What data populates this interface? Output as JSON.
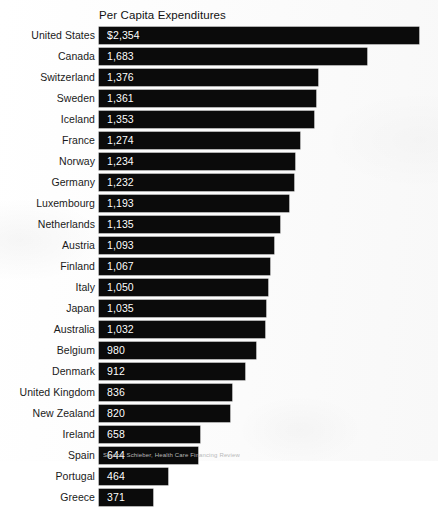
{
  "chart_data": {
    "type": "bar",
    "orientation": "horizontal",
    "title": "Per Capita Expenditures",
    "xlabel": "",
    "ylabel": "",
    "grid": false,
    "legend": null,
    "xlim": [
      0,
      2354
    ],
    "value_labels_inside_bars": true,
    "categories": [
      "United States",
      "Canada",
      "Switzerland",
      "Sweden",
      "Iceland",
      "France",
      "Norway",
      "Germany",
      "Luxembourg",
      "Netherlands",
      "Austria",
      "Finland",
      "Italy",
      "Japan",
      "Australia",
      "Belgium",
      "Denmark",
      "United Kingdom",
      "New Zealand",
      "Ireland",
      "Spain",
      "Portugal",
      "Greece"
    ],
    "values": [
      2354,
      1683,
      1376,
      1361,
      1353,
      1274,
      1234,
      1232,
      1193,
      1135,
      1093,
      1067,
      1050,
      1035,
      1032,
      980,
      912,
      836,
      820,
      658,
      644,
      464,
      371
    ],
    "value_labels": [
      "$2,354",
      "1,683",
      "1,376",
      "1,361",
      "1,353",
      "1,274",
      "1,234",
      "1,232",
      "1,193",
      "1,135",
      "1,093",
      "1,067",
      "1,050",
      "1,035",
      "1,032",
      "980",
      "912",
      "836",
      "820",
      "658",
      "644",
      "464",
      "371"
    ],
    "bar_end_px": [
      419,
      367,
      318,
      316,
      314,
      300,
      295,
      294,
      289,
      280,
      274,
      270,
      268,
      266,
      265,
      256,
      245,
      232,
      230,
      200,
      198,
      168,
      153
    ],
    "bar_color": "#0b0b0b",
    "value_text_color": "#ffffff",
    "label_text_color": "#1a1a1a"
  },
  "footer": {
    "source_note": "Source: Schieber, Health Care Financing Review"
  }
}
